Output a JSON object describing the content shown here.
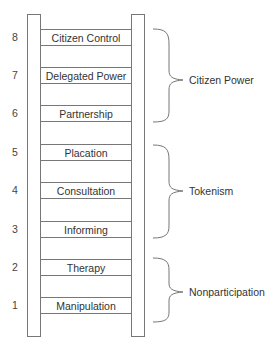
{
  "diagram": {
    "rungs": [
      {
        "level": "8",
        "label": "Citizen Control"
      },
      {
        "level": "7",
        "label": "Delegated Power"
      },
      {
        "level": "6",
        "label": "Partnership"
      },
      {
        "level": "5",
        "label": "Placation"
      },
      {
        "level": "4",
        "label": "Consultation"
      },
      {
        "level": "3",
        "label": "Informing"
      },
      {
        "level": "2",
        "label": "Therapy"
      },
      {
        "level": "1",
        "label": "Manipulation"
      }
    ],
    "groups": [
      {
        "label": "Citizen Power",
        "levels": [
          "8",
          "7",
          "6"
        ]
      },
      {
        "label": "Tokenism",
        "levels": [
          "5",
          "4",
          "3"
        ]
      },
      {
        "label": "Nonparticipation",
        "levels": [
          "2",
          "1"
        ]
      }
    ],
    "colors": {
      "line": "#777777",
      "text": "#333333",
      "background": "#ffffff"
    }
  }
}
